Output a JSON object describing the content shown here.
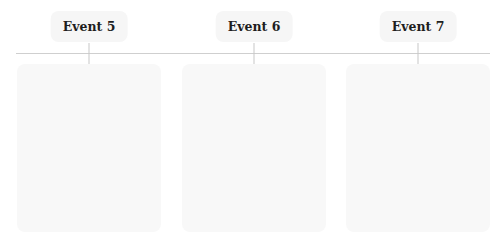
{
  "timeline": {
    "axis_color": "#cfcfcf",
    "events": [
      {
        "label": "Event 5",
        "card_content": ""
      },
      {
        "label": "Event 6",
        "card_content": ""
      },
      {
        "label": "Event 7",
        "card_content": ""
      }
    ]
  }
}
